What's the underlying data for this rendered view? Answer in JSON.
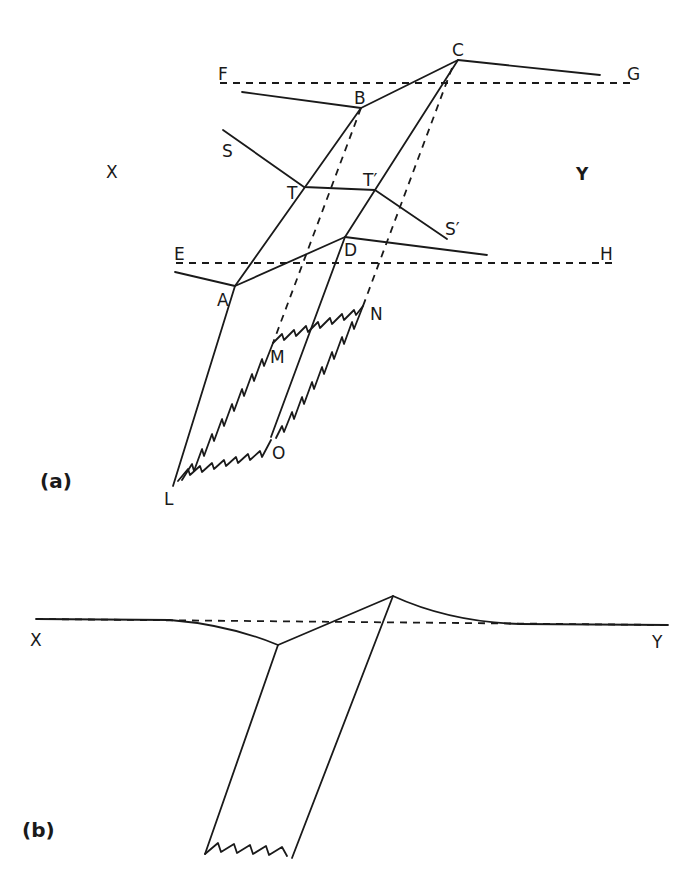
{
  "figure": {
    "panel_a": {
      "label": "(a)",
      "points": {
        "A": "A",
        "B": "B",
        "C": "C",
        "D": "D",
        "E": "E",
        "F": "F",
        "G": "G",
        "H": "H",
        "L": "L",
        "M": "M",
        "N": "N",
        "O": "O",
        "S": "S",
        "S_prime": "S′",
        "T": "T",
        "T_prime": "T′",
        "X": "X",
        "Y": "Y"
      }
    },
    "panel_b": {
      "label": "(b)",
      "points": {
        "X": "X",
        "Y": "Y"
      }
    }
  }
}
